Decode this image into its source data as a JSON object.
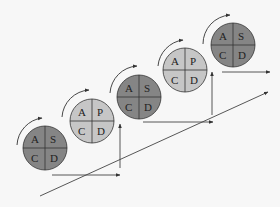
{
  "diagram": {
    "type": "pdca-staircase",
    "colors": {
      "dark_fill": "#858585",
      "light_fill": "#c6c6c6",
      "stroke": "#333333",
      "background": "#f7f7f7"
    },
    "cycles": [
      {
        "id": 1,
        "shade": "dark",
        "cx": 45,
        "cy": 148,
        "quadrants": {
          "top_left": "A",
          "top_right": "S",
          "bottom_left": "C",
          "bottom_right": "D"
        }
      },
      {
        "id": 2,
        "shade": "light",
        "cx": 92,
        "cy": 121,
        "quadrants": {
          "top_left": "A",
          "top_right": "P",
          "bottom_left": "C",
          "bottom_right": "D"
        }
      },
      {
        "id": 3,
        "shade": "dark",
        "cx": 139,
        "cy": 97,
        "quadrants": {
          "top_left": "A",
          "top_right": "S",
          "bottom_left": "C",
          "bottom_right": "D"
        }
      },
      {
        "id": 4,
        "shade": "light",
        "cx": 185,
        "cy": 70,
        "quadrants": {
          "top_left": "A",
          "top_right": "P",
          "bottom_left": "C",
          "bottom_right": "D"
        }
      },
      {
        "id": 5,
        "shade": "dark",
        "cx": 233,
        "cy": 45,
        "quadrants": {
          "top_left": "A",
          "top_right": "S",
          "bottom_left": "C",
          "bottom_right": "D"
        }
      }
    ],
    "radius": 22,
    "arrows": {
      "diagonal": {
        "from": [
          40,
          196
        ],
        "to": [
          268,
          92
        ]
      },
      "horizontal": [
        {
          "from": [
            52,
            175
          ],
          "to": [
            120,
            175
          ]
        },
        {
          "from": [
            143,
            122
          ],
          "to": [
            213,
            122
          ]
        },
        {
          "from": [
            222,
            72
          ],
          "to": [
            270,
            72
          ]
        }
      ],
      "vertical": [
        {
          "from": [
            120,
            175
          ],
          "to": [
            120,
            124
          ]
        },
        {
          "from": [
            212,
            118
          ],
          "to": [
            212,
            72
          ]
        }
      ]
    }
  }
}
